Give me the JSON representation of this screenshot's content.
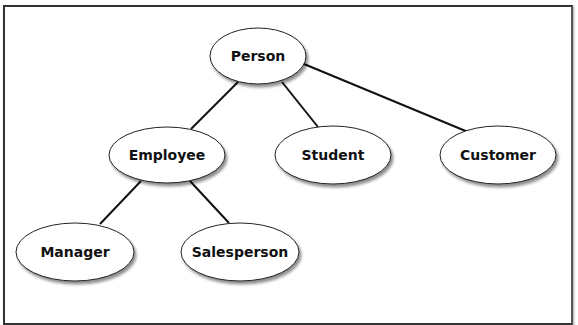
{
  "diagram": {
    "type": "inheritance-hierarchy",
    "colors": {
      "line": "#111111",
      "node_fill": "#ffffff",
      "node_stroke": "#222222",
      "frame": "#333333"
    },
    "nodes": [
      {
        "id": "person",
        "label": "Person",
        "cx": 258,
        "cy": 56,
        "rx": 48,
        "ry": 28
      },
      {
        "id": "employee",
        "label": "Employee",
        "cx": 167,
        "cy": 155,
        "rx": 58,
        "ry": 28
      },
      {
        "id": "student",
        "label": "Student",
        "cx": 333,
        "cy": 155,
        "rx": 58,
        "ry": 29
      },
      {
        "id": "customer",
        "label": "Customer",
        "cx": 498,
        "cy": 155,
        "rx": 58,
        "ry": 29
      },
      {
        "id": "manager",
        "label": "Manager",
        "cx": 75,
        "cy": 252,
        "rx": 59,
        "ry": 29
      },
      {
        "id": "salesperson",
        "label": "Salesperson",
        "cx": 240,
        "cy": 252,
        "rx": 59,
        "ry": 29
      }
    ],
    "edges": [
      {
        "from": "person",
        "to": "employee",
        "x1": 238,
        "y1": 82,
        "x2": 191,
        "y2": 129
      },
      {
        "from": "person",
        "to": "student",
        "x1": 282,
        "y1": 82,
        "x2": 318,
        "y2": 127
      },
      {
        "from": "person",
        "to": "customer",
        "x1": 304,
        "y1": 64,
        "x2": 468,
        "y2": 132
      },
      {
        "from": "employee",
        "to": "manager",
        "x1": 141,
        "y1": 181,
        "x2": 100,
        "y2": 224
      },
      {
        "from": "employee",
        "to": "salesperson",
        "x1": 190,
        "y1": 181,
        "x2": 229,
        "y2": 223
      }
    ]
  }
}
